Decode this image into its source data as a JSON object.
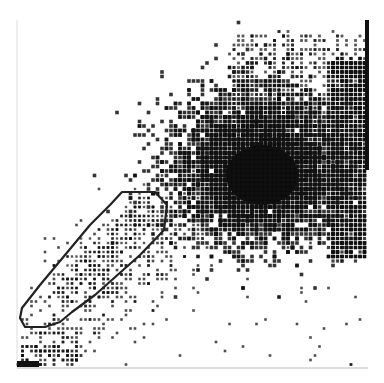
{
  "chart_data": {
    "type": "scatter",
    "subtype": "flow-cytometry-dot-plot",
    "title": "",
    "xlabel": "",
    "ylabel": "",
    "x_ticks": [],
    "y_ticks": [],
    "grid": false,
    "legend": null,
    "frame": {
      "left": 17,
      "top": 20,
      "right": 368,
      "bottom": 368
    },
    "populations": [
      {
        "name": "main-cluster",
        "center": [
          262,
          170
        ],
        "spread": [
          38,
          32
        ],
        "density": "very-high"
      },
      {
        "name": "upper-diffuse",
        "center": [
          300,
          90
        ],
        "spread": [
          60,
          50
        ],
        "density": "medium"
      },
      {
        "name": "diagonal-tail",
        "from": [
          40,
          340
        ],
        "to": [
          230,
          170
        ],
        "density": "low"
      },
      {
        "name": "gated-population",
        "center": [
          110,
          250
        ],
        "density": "medium"
      }
    ],
    "gate": {
      "name": "gate-R1",
      "shape": "polygon",
      "points": [
        [
          122,
          192
        ],
        [
          155,
          192
        ],
        [
          167,
          205
        ],
        [
          164,
          230
        ],
        [
          140,
          255
        ],
        [
          95,
          295
        ],
        [
          72,
          312
        ],
        [
          60,
          322
        ],
        [
          45,
          327
        ],
        [
          25,
          327
        ],
        [
          20,
          318
        ],
        [
          22,
          308
        ],
        [
          40,
          285
        ],
        [
          65,
          255
        ],
        [
          90,
          225
        ],
        [
          110,
          205
        ]
      ]
    },
    "colors": {
      "dots": "#111111",
      "gate": "#222222",
      "axis": "#bbbbbb",
      "right_edge": "#111111"
    }
  }
}
